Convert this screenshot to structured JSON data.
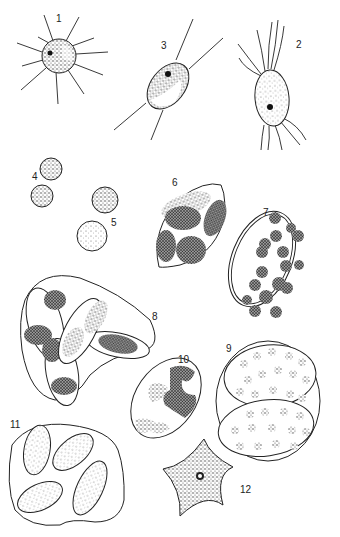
{
  "plate": {
    "description": "Illustration plate of algal cells",
    "figures": [
      {
        "id": "fig-1",
        "label": "1",
        "shape": "spherical cell with radiating setae"
      },
      {
        "id": "fig-2",
        "label": "2",
        "shape": "oval cell with flagella"
      },
      {
        "id": "fig-3",
        "label": "3",
        "shape": "fusiform cell with two spines"
      },
      {
        "id": "fig-4",
        "label": "4",
        "shape": "pair of small round cells"
      },
      {
        "id": "fig-5",
        "label": "5",
        "shape": "pair of round cells"
      },
      {
        "id": "fig-6",
        "label": "6",
        "shape": "lemon-shaped cell with four chloroplasts"
      },
      {
        "id": "fig-7",
        "label": "7",
        "shape": "ellipsoid cell with many chloroplasts"
      },
      {
        "id": "fig-8",
        "label": "8",
        "shape": "colony of elongated cells in mucilage"
      },
      {
        "id": "fig-9",
        "label": "9",
        "shape": "two cells within common envelope"
      },
      {
        "id": "fig-10",
        "label": "10",
        "shape": "ellipsoid cell with irregular chloroplast"
      },
      {
        "id": "fig-11",
        "label": "11",
        "shape": "colony of four cells in mucilage"
      },
      {
        "id": "fig-12",
        "label": "12",
        "shape": "five-pointed star-shaped cell"
      }
    ]
  }
}
